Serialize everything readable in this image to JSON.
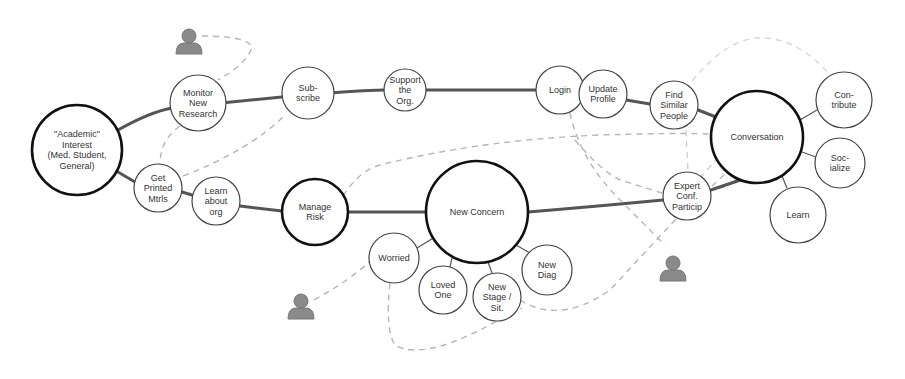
{
  "diagram": {
    "nodes": [
      {
        "id": "academic",
        "lines": [
          "\"Academic\"",
          "Interest",
          "(Med. Student,",
          "General)"
        ],
        "x": 77,
        "y": 150,
        "r": 45,
        "major": true
      },
      {
        "id": "monitor",
        "lines": [
          "Monitor",
          "New",
          "Research"
        ],
        "x": 198,
        "y": 103,
        "r": 28,
        "major": false
      },
      {
        "id": "subscribe",
        "lines": [
          "Sub-",
          "scribe"
        ],
        "x": 308,
        "y": 93,
        "r": 26,
        "major": false
      },
      {
        "id": "support",
        "lines": [
          "Support",
          "the",
          "Org."
        ],
        "x": 405,
        "y": 90,
        "r": 21,
        "major": false
      },
      {
        "id": "login",
        "lines": [
          "Login"
        ],
        "x": 560,
        "y": 90,
        "r": 24,
        "major": false
      },
      {
        "id": "update",
        "lines": [
          "Update",
          "Profile"
        ],
        "x": 603,
        "y": 94,
        "r": 24,
        "major": false
      },
      {
        "id": "find",
        "lines": [
          "Find",
          "Similar",
          "People"
        ],
        "x": 674,
        "y": 105,
        "r": 24,
        "major": false
      },
      {
        "id": "conversation",
        "lines": [
          "Conversation"
        ],
        "x": 757,
        "y": 137,
        "r": 46,
        "major": true
      },
      {
        "id": "contribute",
        "lines": [
          "Con-",
          "tribute"
        ],
        "x": 844,
        "y": 100,
        "r": 28,
        "major": false
      },
      {
        "id": "socialize",
        "lines": [
          "Soc-",
          "ialize"
        ],
        "x": 840,
        "y": 163,
        "r": 25,
        "major": false
      },
      {
        "id": "learn",
        "lines": [
          "Learn"
        ],
        "x": 798,
        "y": 215,
        "r": 28,
        "major": false
      },
      {
        "id": "expert",
        "lines": [
          "Expert",
          "Conf.",
          "Particip"
        ],
        "x": 687,
        "y": 196,
        "r": 24,
        "major": false
      },
      {
        "id": "printed",
        "lines": [
          "Get",
          "Printed",
          "Mtrls"
        ],
        "x": 158,
        "y": 188,
        "r": 24,
        "major": false
      },
      {
        "id": "learnorg",
        "lines": [
          "Learn",
          "about",
          "org"
        ],
        "x": 216,
        "y": 201,
        "r": 24,
        "major": false
      },
      {
        "id": "risk",
        "lines": [
          "Manage",
          "Risk"
        ],
        "x": 315,
        "y": 212,
        "r": 33,
        "major": true
      },
      {
        "id": "concern",
        "lines": [
          "New Concern"
        ],
        "x": 477,
        "y": 212,
        "r": 51,
        "major": true
      },
      {
        "id": "worried",
        "lines": [
          "Worried"
        ],
        "x": 394,
        "y": 258,
        "r": 25,
        "major": false
      },
      {
        "id": "loved",
        "lines": [
          "Loved",
          "One"
        ],
        "x": 443,
        "y": 290,
        "r": 24,
        "major": false
      },
      {
        "id": "stage",
        "lines": [
          "New",
          "Stage /",
          "Sit."
        ],
        "x": 497,
        "y": 297,
        "r": 24,
        "major": false
      },
      {
        "id": "diag",
        "lines": [
          "New",
          "Diag"
        ],
        "x": 547,
        "y": 270,
        "r": 25,
        "major": false
      }
    ],
    "users": [
      {
        "id": "user-1",
        "x": 189,
        "y": 40
      },
      {
        "id": "user-2",
        "x": 301,
        "y": 305
      },
      {
        "id": "user-3",
        "x": 673,
        "y": 267
      }
    ],
    "colors": {
      "stroke": "#222222",
      "path": "#444444",
      "dash": "#bbbbbb",
      "user": "#8a8a8a",
      "label": "#333333"
    }
  }
}
